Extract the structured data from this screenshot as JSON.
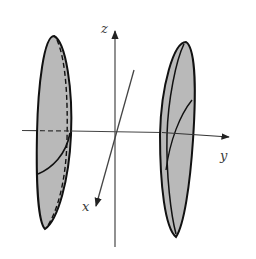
{
  "figure": {
    "axes": {
      "x": {
        "label": "x"
      },
      "y": {
        "label": "y"
      },
      "z": {
        "label": "z"
      }
    },
    "colors": {
      "fill": "#b9b9b9",
      "stroke": "#111111",
      "axis": "#444444",
      "background": "#ffffff"
    },
    "sheets": [
      {
        "name": "left-sheet",
        "side": "negative-y"
      },
      {
        "name": "right-sheet",
        "side": "positive-y"
      }
    ]
  }
}
